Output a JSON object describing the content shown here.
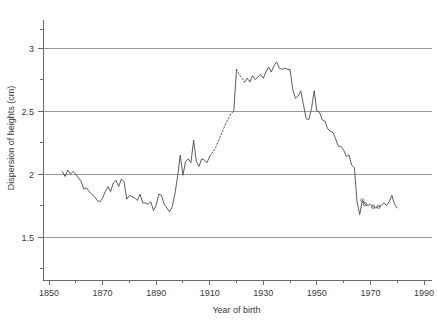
{
  "chart_data": {
    "type": "line",
    "title": "",
    "xlabel": "Year of birth",
    "ylabel": "Dispersion of heights (cm)",
    "xlim": [
      1850,
      1990
    ],
    "ylim": [
      1.28,
      3.18
    ],
    "xticks": [
      1850,
      1870,
      1890,
      1910,
      1930,
      1950,
      1970,
      1990
    ],
    "xtick_labels": [
      "1850",
      "1870",
      "1890",
      "1910",
      "1930",
      "1950",
      "1970",
      "1990"
    ],
    "xminor_ticks": [
      1860,
      1880,
      1900,
      1920,
      1940,
      1960,
      1980
    ],
    "yticks": [
      1.5,
      2.0,
      2.5,
      3.0
    ],
    "ytick_labels": [
      "1.5",
      "2",
      "2.5",
      "3"
    ],
    "yminor_ticks": [
      1.25,
      1.75,
      2.25,
      2.75,
      3.15
    ],
    "grid": "horizontal",
    "legend": "none",
    "line_color": "#4a4a4a",
    "grid_color": "#999999",
    "background": "#ffffff",
    "series": [
      {
        "name": "Dispersion of heights",
        "style": "solid",
        "segments": [
          {
            "style": "solid",
            "x": [
              1855,
              1856,
              1857,
              1858,
              1859,
              1860,
              1861,
              1862,
              1863,
              1864,
              1865,
              1866,
              1867,
              1868,
              1869,
              1870,
              1871,
              1872,
              1873,
              1874,
              1875,
              1876,
              1877,
              1878,
              1879,
              1880,
              1881,
              1882,
              1883,
              1884,
              1885,
              1886,
              1887,
              1888,
              1889,
              1890,
              1891,
              1892,
              1893,
              1894,
              1895,
              1896,
              1897,
              1898,
              1899,
              1900,
              1901,
              1902,
              1903,
              1904,
              1905,
              1906,
              1907,
              1908,
              1909,
              1910
            ],
            "y": [
              2.02,
              1.98,
              2.03,
              2.0,
              2.02,
              2.0,
              1.97,
              1.94,
              1.88,
              1.89,
              1.86,
              1.84,
              1.82,
              1.79,
              1.78,
              1.81,
              1.86,
              1.9,
              1.86,
              1.93,
              1.95,
              1.9,
              1.96,
              1.94,
              1.8,
              1.83,
              1.82,
              1.81,
              1.79,
              1.84,
              1.77,
              1.77,
              1.76,
              1.78,
              1.71,
              1.75,
              1.84,
              1.83,
              1.76,
              1.73,
              1.7,
              1.74,
              1.84,
              1.98,
              2.15,
              1.99,
              2.1,
              2.12,
              2.09,
              2.27,
              2.1,
              2.06,
              2.12,
              2.11,
              2.09,
              2.14
            ]
          },
          {
            "style": "dashed",
            "x": [
              1910,
              1912,
              1914,
              1916,
              1918,
              1919
            ],
            "y": [
              2.14,
              2.2,
              2.3,
              2.4,
              2.48,
              2.5
            ]
          },
          {
            "style": "solid",
            "x": [
              1919,
              1920
            ],
            "y": [
              2.5,
              2.83
            ]
          },
          {
            "style": "dashed",
            "x": [
              1920,
              1921,
              1922,
              1923
            ],
            "y": [
              2.83,
              2.79,
              2.76,
              2.73
            ]
          },
          {
            "style": "solid",
            "x": [
              1923,
              1924,
              1925,
              1926,
              1927,
              1928,
              1929,
              1930,
              1931,
              1932,
              1933,
              1934,
              1935,
              1936,
              1937,
              1938,
              1939,
              1940,
              1941,
              1942,
              1943,
              1944,
              1945,
              1946,
              1947,
              1948,
              1949,
              1950,
              1951,
              1952,
              1953,
              1954,
              1955,
              1956,
              1957,
              1958,
              1959,
              1960,
              1961,
              1962,
              1963,
              1964,
              1965,
              1966
            ],
            "y": [
              2.73,
              2.76,
              2.73,
              2.78,
              2.75,
              2.77,
              2.79,
              2.76,
              2.81,
              2.85,
              2.81,
              2.86,
              2.89,
              2.84,
              2.83,
              2.84,
              2.83,
              2.83,
              2.67,
              2.6,
              2.62,
              2.66,
              2.55,
              2.44,
              2.43,
              2.52,
              2.66,
              2.5,
              2.49,
              2.43,
              2.42,
              2.36,
              2.34,
              2.33,
              2.28,
              2.22,
              2.22,
              2.19,
              2.14,
              2.15,
              2.07,
              2.05,
              1.78,
              1.68
            ]
          },
          {
            "style": "solid",
            "x": [
              1966,
              1967,
              1968,
              1969,
              1970,
              1971,
              1972,
              1973,
              1974,
              1975,
              1976,
              1977,
              1978,
              1979,
              1980
            ],
            "y": [
              1.68,
              1.79,
              1.76,
              1.75,
              1.76,
              1.74,
              1.73,
              1.74,
              1.75,
              1.77,
              1.75,
              1.78,
              1.83,
              1.76,
              1.73
            ]
          }
        ],
        "markers": [
          {
            "x": 1967,
            "y": 1.79
          },
          {
            "x": 1968,
            "y": 1.76
          },
          {
            "x": 1971,
            "y": 1.74
          },
          {
            "x": 1973,
            "y": 1.74
          }
        ]
      }
    ]
  },
  "figure": {
    "caption_strip": ""
  }
}
